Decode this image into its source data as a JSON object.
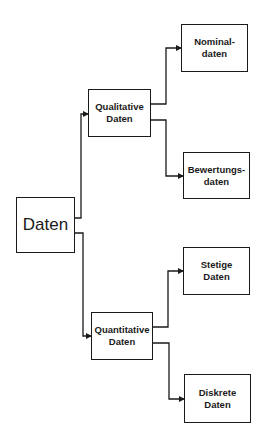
{
  "diagram": {
    "type": "tree",
    "root": {
      "id": "daten",
      "label": "Daten"
    },
    "nodes": [
      {
        "id": "daten",
        "label": "Daten",
        "x": 16,
        "y": 197,
        "w": 59,
        "h": 56
      },
      {
        "id": "qualitative",
        "label": "Qualitative\nDaten",
        "x": 88,
        "y": 89,
        "w": 63,
        "h": 48
      },
      {
        "id": "quantitative",
        "label": "Quantitative\nDaten",
        "x": 91,
        "y": 312,
        "w": 62,
        "h": 48
      },
      {
        "id": "nominal",
        "label": "Nominal-\ndaten",
        "x": 181,
        "y": 24,
        "w": 67,
        "h": 48
      },
      {
        "id": "bewertungs",
        "label": "Bewertungs-\ndaten",
        "x": 183,
        "y": 152,
        "w": 67,
        "h": 47
      },
      {
        "id": "stetige",
        "label": "Stetige\nDaten",
        "x": 183,
        "y": 247,
        "w": 67,
        "h": 48
      },
      {
        "id": "diskrete",
        "label": "Diskrete\nDaten",
        "x": 184,
        "y": 374,
        "w": 67,
        "h": 49
      }
    ],
    "edges": [
      {
        "from": "daten",
        "to": "qualitative"
      },
      {
        "from": "daten",
        "to": "quantitative"
      },
      {
        "from": "qualitative",
        "to": "nominal"
      },
      {
        "from": "qualitative",
        "to": "bewertungs"
      },
      {
        "from": "quantitative",
        "to": "stetige"
      },
      {
        "from": "quantitative",
        "to": "diskrete"
      }
    ],
    "colors": {
      "line": "#1a1a1a",
      "background": "#ffffff"
    }
  }
}
